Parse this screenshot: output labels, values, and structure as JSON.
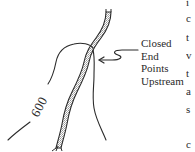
{
  "diagram": {
    "contour_label": "600",
    "callout": {
      "lines": [
        "Closed",
        "End",
        "Points",
        "Upstream"
      ]
    },
    "clipped_text_column": [
      {
        "char": "i",
        "y": 0
      },
      {
        "char": "c",
        "y": 14
      },
      {
        "char": "t",
        "y": 33
      },
      {
        "char": "v",
        "y": 51
      },
      {
        "char": "t",
        "y": 70
      },
      {
        "char": "a",
        "y": 88
      },
      {
        "char": "s",
        "y": 105
      },
      {
        "char": "c",
        "y": 140
      }
    ],
    "colors": {
      "ink": "#2a2a2a",
      "stream_fill": "#bdbdbd",
      "background": "#ffffff"
    }
  }
}
